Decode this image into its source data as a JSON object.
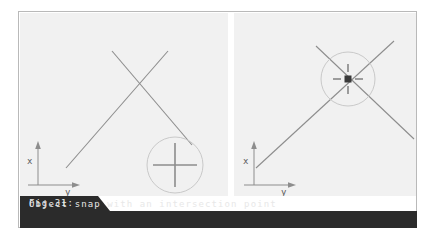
{
  "figure": {
    "caption_tab": "Fig.31:",
    "caption_text": "Object snap with an intersection point",
    "caption_bg": "#2b2b2b",
    "caption_fg": "#e8e8e8",
    "panel_bg": "#f1f1f1",
    "frame_border": "#b9b9b9",
    "line_color": "#8d8d8d",
    "axis_color": "#8d8d8d",
    "aperture_color": "#c6c6c6",
    "snap_marker_color": "#4a4a4a",
    "crosshair_color": "#8d8d8d"
  },
  "panels": [
    {
      "id": "left-panel",
      "name": "before-snap-view",
      "axis": {
        "x_label": "x",
        "y_label": "y"
      },
      "lines": [
        {
          "name": "line-a",
          "x1": 46,
          "y1": 155,
          "x2": 148,
          "y2": 38
        },
        {
          "name": "line-b",
          "x1": 92,
          "y1": 38,
          "x2": 172,
          "y2": 132
        }
      ],
      "aperture": {
        "cx": 155,
        "cy": 152,
        "r": 28
      },
      "cursor": {
        "name": "crosshair-cursor",
        "cx": 155,
        "cy": 152,
        "arm": 22
      }
    },
    {
      "id": "right-panel",
      "name": "after-snap-view",
      "axis": {
        "x_label": "x",
        "y_label": "y"
      },
      "lines": [
        {
          "name": "line-a",
          "x1": 22,
          "y1": 155,
          "x2": 128,
          "y2": 38
        },
        {
          "name": "line-b",
          "x1": 82,
          "y1": 36,
          "x2": 178,
          "y2": 122
        }
      ],
      "aperture": {
        "cx": 114,
        "cy": 66,
        "r": 27
      },
      "snap_marker": {
        "name": "intersection-snap-marker",
        "cx": 114,
        "cy": 66,
        "size": 6,
        "tick": 9
      }
    }
  ]
}
